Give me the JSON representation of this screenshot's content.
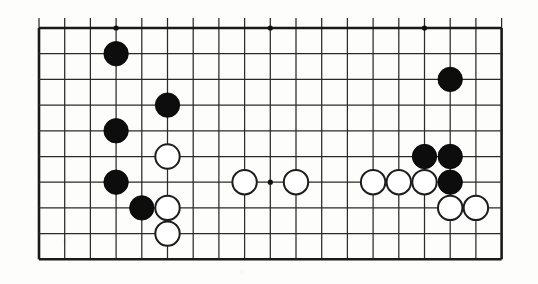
{
  "figure": {
    "kind": "go-board-diagram",
    "title": "",
    "caption": ""
  },
  "board": {
    "type": "partial-go-board",
    "columns": 19,
    "rows": 10,
    "orientation": "top-portion",
    "grid_color": "#2a2a2a",
    "edge_color": "#1a1a1a",
    "background_color": "#fdfdfb",
    "left_px": 39,
    "top_px": 28,
    "cell_px": 25.7,
    "stone_radius_px": 12.2,
    "top_edge_is_board_edge": true,
    "bottom_edge_is_cut": true,
    "hoshi_points": [
      {
        "col": 4,
        "row": 1
      },
      {
        "col": 10,
        "row": 1
      },
      {
        "col": 16,
        "row": 1
      },
      {
        "col": 10,
        "row": 7
      }
    ]
  },
  "stones": {
    "black_label": "Black",
    "white_label": "White",
    "black": [
      {
        "col": 4,
        "row": 2
      },
      {
        "col": 6,
        "row": 4
      },
      {
        "col": 4,
        "row": 5
      },
      {
        "col": 4,
        "row": 7
      },
      {
        "col": 5,
        "row": 8
      },
      {
        "col": 17,
        "row": 3
      },
      {
        "col": 16,
        "row": 6
      },
      {
        "col": 17,
        "row": 6
      },
      {
        "col": 17,
        "row": 7
      }
    ],
    "white": [
      {
        "col": 6,
        "row": 6
      },
      {
        "col": 6,
        "row": 8
      },
      {
        "col": 6,
        "row": 9
      },
      {
        "col": 9,
        "row": 7
      },
      {
        "col": 11,
        "row": 7
      },
      {
        "col": 14,
        "row": 7
      },
      {
        "col": 15,
        "row": 7
      },
      {
        "col": 16,
        "row": 7
      },
      {
        "col": 17,
        "row": 8
      },
      {
        "col": 18,
        "row": 8
      }
    ]
  },
  "counts": {
    "black_count": 9,
    "white_count": 10
  }
}
